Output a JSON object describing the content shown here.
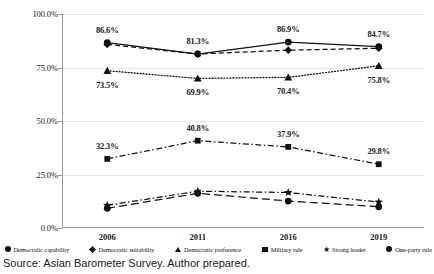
{
  "source_note": "Source: Asian Barometer Survey. Author prepared.",
  "legend": {
    "items": [
      {
        "label": "Democratic capability",
        "marker": "circle-marker"
      },
      {
        "label": "Democratic suitability",
        "marker": "diamond-marker"
      },
      {
        "label": "Democratic preference",
        "marker": "triangle-marker"
      },
      {
        "label": "Military rule",
        "marker": "square-marker"
      },
      {
        "label": "Strong leader",
        "marker": "star-marker"
      },
      {
        "label": "One-party rule",
        "marker": "circle-marker"
      }
    ]
  },
  "chart_data": {
    "type": "line",
    "title": "",
    "xlabel": "",
    "ylabel": "",
    "categories": [
      "2006",
      "2011",
      "2016",
      "2019"
    ],
    "ylim": [
      0,
      100
    ],
    "yticks": [
      0,
      25,
      50,
      75,
      100
    ],
    "ytick_labels": [
      "0.0%",
      "25.0%",
      "50.0%",
      "75.0%",
      "100.0%"
    ],
    "grid": true,
    "legend_position": "bottom",
    "series": [
      {
        "name": "Democratic capability",
        "marker": "circle",
        "line_style": "solid",
        "values": [
          86.6,
          81.3,
          86.9,
          84.7
        ],
        "labels": [
          "86.6%",
          "81.3%",
          "86.9%",
          "84.7%"
        ],
        "labelled": true
      },
      {
        "name": "Democratic suitability",
        "marker": "diamond",
        "line_style": "dashed",
        "values": [
          85.8,
          81.3,
          83.1,
          84.0
        ],
        "labels": [
          "",
          "",
          "",
          ""
        ],
        "labelled": false
      },
      {
        "name": "Democratic preference",
        "marker": "triangle",
        "line_style": "dotted",
        "values": [
          73.5,
          69.9,
          70.4,
          75.8
        ],
        "labels": [
          "73.5%",
          "69.9%",
          "70.4%",
          "75.8%"
        ],
        "labelled": true
      },
      {
        "name": "Military rule",
        "marker": "square",
        "line_style": "dashdot",
        "values": [
          32.3,
          40.8,
          37.9,
          29.8
        ],
        "labels": [
          "32.3%",
          "40.8%",
          "37.9%",
          "29.8%"
        ],
        "labelled": true
      },
      {
        "name": "Strong leader",
        "marker": "star",
        "line_style": "dashdot",
        "values": [
          10.6,
          17.2,
          16.6,
          12.1
        ],
        "labels": [
          "",
          "",
          "",
          ""
        ],
        "labelled": false
      },
      {
        "name": "One-party rule",
        "marker": "circle",
        "line_style": "longdash",
        "values": [
          9.2,
          16.2,
          12.6,
          9.9
        ],
        "labels": [
          "",
          "",
          "",
          ""
        ],
        "labelled": false
      }
    ],
    "data_label_offsets": [
      {
        "series": 0,
        "point": 0,
        "dx": 0,
        "dy": -13
      },
      {
        "series": 0,
        "point": 1,
        "dx": 0,
        "dy": -13
      },
      {
        "series": 0,
        "point": 2,
        "dx": 0,
        "dy": -13
      },
      {
        "series": 0,
        "point": 3,
        "dx": 0,
        "dy": -13
      },
      {
        "series": 2,
        "point": 0,
        "dx": 0,
        "dy": 14
      },
      {
        "series": 2,
        "point": 1,
        "dx": 0,
        "dy": 14
      },
      {
        "series": 2,
        "point": 2,
        "dx": 0,
        "dy": 14
      },
      {
        "series": 2,
        "point": 3,
        "dx": 0,
        "dy": 14
      },
      {
        "series": 3,
        "point": 0,
        "dx": 0,
        "dy": -13
      },
      {
        "series": 3,
        "point": 1,
        "dx": 0,
        "dy": -13
      },
      {
        "series": 3,
        "point": 2,
        "dx": 0,
        "dy": -13
      },
      {
        "series": 3,
        "point": 3,
        "dx": 0,
        "dy": -13
      }
    ]
  }
}
